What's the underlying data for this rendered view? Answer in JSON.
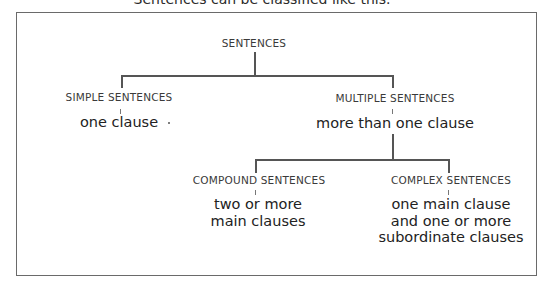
{
  "caption": "Sentences can be classified like this.",
  "tree": {
    "root": {
      "label": "SENTENCES"
    },
    "simple": {
      "label": "SIMPLE SENTENCES",
      "description": [
        "one clause"
      ]
    },
    "multiple": {
      "label": "MULTIPLE SENTENCES",
      "description": [
        "more than one clause"
      ]
    },
    "compound": {
      "label": "COMPOUND SENTENCES",
      "description": [
        "two or more",
        "main clauses"
      ]
    },
    "complex": {
      "label": "COMPLEX SENTENCES",
      "description": [
        "one main clause",
        "and one or more",
        "subordinate clauses"
      ]
    }
  },
  "colors": {
    "text": "#222222",
    "label": "#3a3a3a",
    "line": "#555555",
    "frame": "#6a6a6a"
  }
}
